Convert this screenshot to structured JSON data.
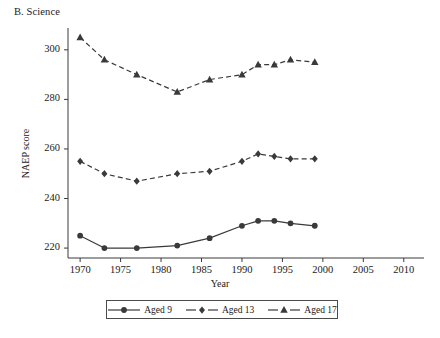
{
  "chart_data": {
    "type": "line",
    "title": "B. Science",
    "xlabel": "Year",
    "ylabel": "NAEP score",
    "xlim": [
      1968.5,
      2012.5
    ],
    "ylim": [
      216,
      308
    ],
    "grid": false,
    "legend_position": "bottom",
    "xticks": [
      1970,
      1975,
      1980,
      1985,
      1990,
      1995,
      2000,
      2005,
      2010
    ],
    "xticklabels": [
      "1970",
      "1975",
      "1980",
      "1985",
      "1990",
      "1995",
      "2000",
      "2005",
      "2010"
    ],
    "yticks": [
      220,
      240,
      260,
      280,
      300
    ],
    "yticklabels": [
      "220",
      "240",
      "260",
      "280",
      "300"
    ],
    "series": [
      {
        "name": "Aged 9",
        "marker": "circle",
        "linestyle": "solid",
        "color": "#3a3a3a",
        "x": [
          1970,
          1973,
          1977,
          1982,
          1986,
          1990,
          1992,
          1994,
          1996,
          1999
        ],
        "values": [
          225,
          220,
          220,
          221,
          224,
          229,
          231,
          231,
          230,
          229
        ]
      },
      {
        "name": "Aged 13",
        "marker": "diamond",
        "linestyle": "dashed",
        "color": "#3a3a3a",
        "x": [
          1970,
          1973,
          1977,
          1982,
          1986,
          1990,
          1992,
          1994,
          1996,
          1999
        ],
        "values": [
          255,
          250,
          247,
          250,
          251,
          255,
          258,
          257,
          256,
          256
        ]
      },
      {
        "name": "Aged 17",
        "marker": "triangle",
        "linestyle": "dashed",
        "color": "#3a3a3a",
        "x": [
          1970,
          1973,
          1977,
          1982,
          1986,
          1990,
          1992,
          1994,
          1996,
          1999
        ],
        "values": [
          305,
          296,
          290,
          283,
          288,
          290,
          294,
          294,
          296,
          295
        ]
      }
    ]
  },
  "legend": {
    "items": [
      {
        "label": "Aged 9",
        "marker": "circle",
        "linestyle": "solid"
      },
      {
        "label": "Aged 13",
        "marker": "diamond",
        "linestyle": "dashed"
      },
      {
        "label": "Aged 17",
        "marker": "triangle",
        "linestyle": "dashed"
      }
    ]
  },
  "style": {
    "ink": "#3a3a3a",
    "axis": "#3a3a3a",
    "background": "#ffffff"
  }
}
